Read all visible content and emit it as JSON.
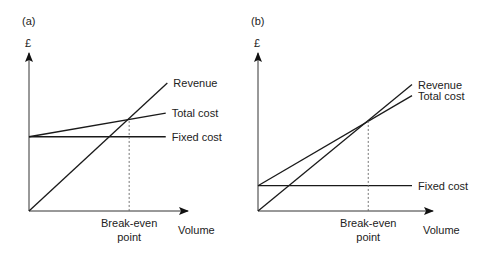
{
  "chart_data": [
    {
      "type": "line",
      "panel_label": "(a)",
      "ylabel": "£",
      "xlabel": "Volume",
      "annotation": [
        "Break-even",
        "point"
      ],
      "xlim": [
        0,
        100
      ],
      "ylim": [
        0,
        100
      ],
      "series": [
        {
          "name": "Revenue",
          "x": [
            0,
            87
          ],
          "y": [
            0,
            81
          ]
        },
        {
          "name": "Total cost",
          "x": [
            0,
            86
          ],
          "y": [
            47,
            62
          ]
        },
        {
          "name": "Fixed cost",
          "x": [
            0,
            86
          ],
          "y": [
            47,
            47
          ]
        }
      ],
      "break_even": {
        "x": 63,
        "y": 57
      }
    },
    {
      "type": "line",
      "panel_label": "(b)",
      "ylabel": "£",
      "xlabel": "Volume",
      "annotation": [
        "Break-even",
        "point"
      ],
      "xlim": [
        0,
        100
      ],
      "ylim": [
        0,
        100
      ],
      "series": [
        {
          "name": "Revenue",
          "x": [
            0,
            88
          ],
          "y": [
            0,
            80
          ]
        },
        {
          "name": "Total cost",
          "x": [
            0,
            88
          ],
          "y": [
            16,
            73
          ]
        },
        {
          "name": "Fixed cost",
          "x": [
            0,
            88
          ],
          "y": [
            16,
            16
          ]
        }
      ],
      "break_even": {
        "x": 63,
        "y": 57
      }
    }
  ]
}
